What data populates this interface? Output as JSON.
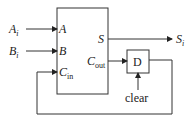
{
  "diagram": {
    "inputs": [
      {
        "name": "A",
        "sub": "i"
      },
      {
        "name": "B",
        "sub": "i"
      }
    ],
    "output": {
      "name": "S",
      "sub": "i"
    },
    "adder": {
      "ports_in": [
        {
          "name": "A",
          "sub": ""
        },
        {
          "name": "B",
          "sub": ""
        },
        {
          "name": "C",
          "sub": "in"
        }
      ],
      "ports_out": [
        {
          "name": "S",
          "sub": ""
        },
        {
          "name": "C",
          "sub": "out"
        }
      ]
    },
    "flipflop": {
      "label": "D",
      "control": "clear"
    }
  }
}
